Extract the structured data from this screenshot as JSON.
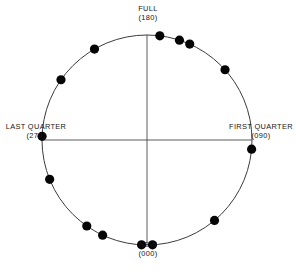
{
  "chart_data": {
    "type": "scatter",
    "title": "",
    "subtitle": "",
    "xlabel": "",
    "ylabel": "",
    "coordinate_system": "circular",
    "units": "degrees of lunar phase angle",
    "angle_range": [
      0,
      360
    ],
    "grid": false,
    "legend": null,
    "legend_position": "none",
    "axis_labels": [
      {
        "id": "new",
        "name": "NEW",
        "angle_text": "(000)",
        "angle": 0,
        "position": "bottom"
      },
      {
        "id": "first_quarter",
        "name": "FIRST QUARTER",
        "angle_text": "(090)",
        "angle": 90,
        "position": "right"
      },
      {
        "id": "full",
        "name": "FULL",
        "angle_text": "(180)",
        "angle": 180,
        "position": "top"
      },
      {
        "id": "last_quarter",
        "name": "LAST QUARTER",
        "angle_text": "(270)",
        "angle": 270,
        "position": "left"
      }
    ],
    "n_points": 14,
    "values": [
      7,
      18,
      24,
      48,
      95,
      140,
      177,
      183,
      205,
      215,
      248,
      272,
      305,
      330
    ],
    "points": [
      {
        "angle": 7,
        "label": ""
      },
      {
        "angle": 18,
        "label": ""
      },
      {
        "angle": 24,
        "label": ""
      },
      {
        "angle": 48,
        "label": ""
      },
      {
        "angle": 95,
        "label": ""
      },
      {
        "angle": 140,
        "label": ""
      },
      {
        "angle": 177,
        "label": ""
      },
      {
        "angle": 183,
        "label": ""
      },
      {
        "angle": 205,
        "label": ""
      },
      {
        "angle": 215,
        "label": ""
      },
      {
        "angle": 248,
        "label": ""
      },
      {
        "angle": 272,
        "label": ""
      },
      {
        "angle": 305,
        "label": ""
      },
      {
        "angle": 330,
        "label": ""
      }
    ],
    "geometry": {
      "center_x": 147,
      "center_y": 140,
      "radius": 105,
      "point_radius": 4.6
    },
    "colors": {
      "point": "#050505",
      "circle": "#3c3c3c",
      "axis": "#4a4a4a",
      "background": "#ffffff",
      "text": "#171717"
    }
  }
}
